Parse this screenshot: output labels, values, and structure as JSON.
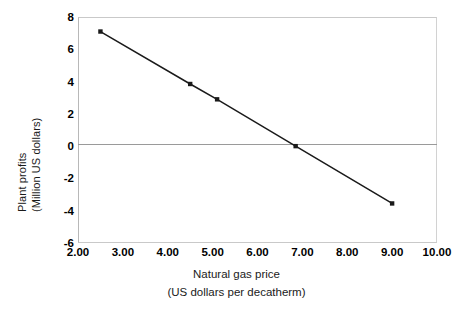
{
  "chart_data": {
    "type": "line",
    "title": "",
    "xlabel": "Natural gas price (US dollars per decatherm)",
    "ylabel": "Plant profits (Million US dollars)",
    "xlim": [
      2.0,
      10.0
    ],
    "ylim": [
      -6,
      8
    ],
    "grid": false,
    "legend": "none",
    "marker": "square",
    "line_color": "#1a1a1a",
    "marker_color": "#1a1a1a",
    "zero_line_color": "#9a9a9a",
    "frame_color": "#c9c9c9",
    "x": [
      2.5,
      4.5,
      5.1,
      6.85,
      9.0
    ],
    "y": [
      7.1,
      3.85,
      2.9,
      0.0,
      -3.55
    ],
    "points": [
      {
        "x": 2.5,
        "y": 7.1
      },
      {
        "x": 4.5,
        "y": 3.85
      },
      {
        "x": 5.1,
        "y": 2.9
      },
      {
        "x": 6.85,
        "y": 0.0
      },
      {
        "x": 9.0,
        "y": -3.55
      }
    ],
    "xticks": [
      2.0,
      3.0,
      4.0,
      5.0,
      6.0,
      7.0,
      8.0,
      9.0,
      10.0
    ],
    "xtick_labels": [
      "2.00",
      "3.00",
      "4.00",
      "5.00",
      "6.00",
      "7.00",
      "8.00",
      "9.00",
      "10.00"
    ],
    "yticks": [
      8,
      6,
      4,
      2,
      0,
      -2,
      -4,
      -6
    ],
    "ytick_labels": [
      "8",
      "6",
      "4",
      "2",
      "0",
      "-2",
      "-4",
      "-6"
    ]
  },
  "axis": {
    "y_title_line1": "Plant profits",
    "y_title_line2": "(Million US dollars)",
    "x_title_line1": "Natural gas price",
    "x_title_line2": "(US dollars per decatherm)"
  }
}
